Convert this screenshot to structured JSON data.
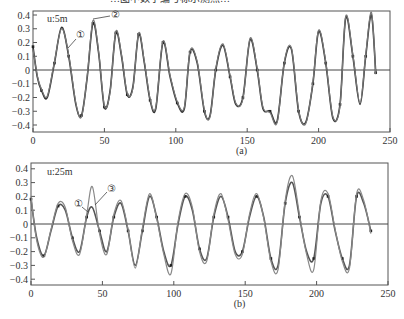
{
  "figure": {
    "top_text_fragment": "…图中数字编号标示测点…",
    "panels": [
      {
        "id": "a",
        "label": "(a)",
        "annotation": "u:5m",
        "callouts": [
          "①",
          "②"
        ]
      },
      {
        "id": "b",
        "label": "(b)",
        "annotation": "u:25m",
        "callouts": [
          "①",
          "③"
        ]
      }
    ]
  },
  "chart_data": [
    {
      "type": "line",
      "title": "(a)",
      "annotation": "u:5m",
      "xlabel": "",
      "ylabel": "",
      "xlim": [
        0,
        250
      ],
      "ylim": [
        -0.45,
        0.45
      ],
      "xticks": [
        0,
        50,
        100,
        150,
        200,
        250
      ],
      "yticks": [
        0.4,
        0.3,
        0.2,
        0.1,
        0,
        -0.1,
        -0.2,
        -0.3,
        -0.4
      ],
      "grid": false,
      "zero_line": true,
      "series": [
        {
          "name": "①",
          "x": [
            0,
            3,
            6,
            10,
            15,
            20,
            25,
            30,
            34,
            38,
            42,
            46,
            50,
            54,
            58,
            62,
            66,
            70,
            74,
            78,
            82,
            86,
            91,
            96,
            101,
            106,
            110,
            115,
            120,
            124,
            128,
            133,
            138,
            142,
            147,
            152,
            157,
            161,
            166,
            171,
            176,
            181,
            186,
            191,
            196,
            200,
            205,
            210,
            215,
            219,
            224,
            229,
            233,
            237,
            240
          ],
          "y": [
            0.17,
            -0.05,
            -0.15,
            -0.2,
            0.05,
            0.31,
            0.1,
            -0.25,
            -0.33,
            -0.05,
            0.34,
            0.12,
            -0.27,
            -0.15,
            0.27,
            0.1,
            -0.18,
            -0.12,
            0.26,
            0.05,
            -0.22,
            -0.28,
            0.2,
            -0.05,
            -0.24,
            -0.28,
            0.13,
            0.05,
            -0.3,
            -0.33,
            0.0,
            0.18,
            -0.05,
            -0.25,
            -0.2,
            0.22,
            0.0,
            -0.28,
            -0.3,
            -0.37,
            0.05,
            0.15,
            -0.3,
            -0.38,
            -0.1,
            0.28,
            0.05,
            -0.35,
            -0.25,
            0.38,
            0.1,
            -0.25,
            0.1,
            0.4,
            -0.02
          ]
        },
        {
          "name": "②",
          "x": [
            0,
            3,
            6,
            10,
            15,
            20,
            25,
            30,
            34,
            38,
            42,
            46,
            50,
            54,
            58,
            62,
            66,
            70,
            74,
            78,
            82,
            86,
            91,
            96,
            101,
            106,
            110,
            115,
            120,
            124,
            128,
            133,
            138,
            142,
            147,
            152,
            157,
            161,
            166,
            171,
            176,
            181,
            186,
            191,
            196,
            200,
            205,
            210,
            215,
            219,
            224,
            229,
            233,
            237,
            240
          ],
          "y": [
            0.15,
            -0.04,
            -0.14,
            -0.19,
            0.06,
            0.3,
            0.11,
            -0.24,
            -0.34,
            -0.04,
            0.36,
            0.13,
            -0.26,
            -0.16,
            0.28,
            0.11,
            -0.17,
            -0.13,
            0.27,
            0.06,
            -0.21,
            -0.27,
            0.21,
            -0.04,
            -0.23,
            -0.27,
            0.14,
            0.06,
            -0.29,
            -0.34,
            0.01,
            0.19,
            -0.04,
            -0.24,
            -0.21,
            0.23,
            0.01,
            -0.27,
            -0.31,
            -0.38,
            0.06,
            0.16,
            -0.29,
            -0.39,
            -0.09,
            0.29,
            0.06,
            -0.34,
            -0.26,
            0.39,
            0.11,
            -0.24,
            0.11,
            0.42,
            -0.03
          ]
        }
      ]
    },
    {
      "type": "line",
      "title": "(b)",
      "annotation": "u:25m",
      "xlabel": "",
      "ylabel": "",
      "xlim": [
        0,
        250
      ],
      "ylim": [
        -0.45,
        0.45
      ],
      "xticks": [
        0,
        50,
        100,
        150,
        200,
        250
      ],
      "yticks": [
        0.4,
        0.3,
        0.2,
        0.1,
        0,
        -0.1,
        -0.2,
        -0.3,
        -0.4
      ],
      "grid": false,
      "zero_line": true,
      "series": [
        {
          "name": "①",
          "x": [
            0,
            4,
            9,
            14,
            19,
            24,
            29,
            34,
            39,
            43,
            48,
            53,
            58,
            63,
            68,
            73,
            78,
            83,
            88,
            93,
            98,
            103,
            108,
            113,
            118,
            123,
            128,
            133,
            138,
            143,
            148,
            153,
            158,
            163,
            168,
            173,
            178,
            183,
            188,
            193,
            198,
            203,
            208,
            213,
            218,
            223,
            228,
            233,
            238
          ],
          "y": [
            0.18,
            -0.1,
            -0.23,
            -0.05,
            0.13,
            0.1,
            -0.1,
            -0.2,
            0.05,
            0.12,
            -0.05,
            -0.2,
            0.05,
            0.15,
            -0.05,
            -0.3,
            -0.05,
            0.2,
            0.05,
            -0.2,
            -0.3,
            0.0,
            0.2,
            0.1,
            -0.18,
            -0.25,
            0.05,
            0.2,
            0.05,
            -0.2,
            -0.2,
            0.05,
            0.2,
            0.05,
            -0.25,
            -0.3,
            0.15,
            0.3,
            0.05,
            -0.2,
            -0.25,
            0.15,
            0.2,
            -0.05,
            -0.25,
            -0.3,
            0.2,
            0.15,
            -0.05
          ],
          "color": "#555555"
        },
        {
          "name": "③",
          "x": [
            0,
            4,
            9,
            14,
            19,
            24,
            29,
            34,
            39,
            43,
            48,
            53,
            58,
            63,
            68,
            73,
            78,
            83,
            88,
            93,
            98,
            103,
            108,
            113,
            118,
            123,
            128,
            133,
            138,
            143,
            148,
            153,
            158,
            163,
            168,
            173,
            178,
            183,
            188,
            193,
            198,
            203,
            208,
            213,
            218,
            223,
            228,
            233,
            238
          ],
          "y": [
            0.2,
            -0.12,
            -0.24,
            -0.04,
            0.15,
            0.12,
            -0.12,
            -0.22,
            0.07,
            0.27,
            -0.07,
            -0.22,
            0.07,
            0.17,
            -0.04,
            -0.32,
            -0.03,
            0.22,
            0.04,
            -0.22,
            -0.36,
            0.02,
            0.22,
            0.12,
            -0.2,
            -0.27,
            0.07,
            0.22,
            0.03,
            -0.22,
            -0.22,
            0.07,
            0.22,
            0.04,
            -0.27,
            -0.33,
            0.17,
            0.35,
            0.07,
            -0.22,
            -0.33,
            0.17,
            0.22,
            -0.04,
            -0.27,
            -0.32,
            0.22,
            0.17,
            -0.07
          ],
          "color": "#888888"
        }
      ]
    }
  ]
}
